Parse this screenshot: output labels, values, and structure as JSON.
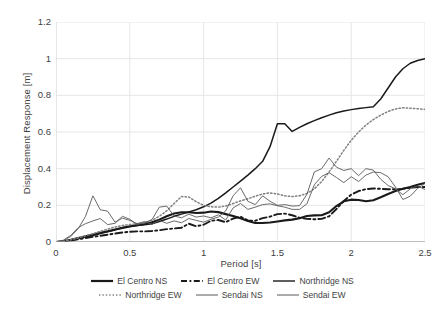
{
  "chart_data": {
    "type": "line",
    "title": "",
    "xlabel": "Period [s]",
    "ylabel": "Displacement Response [m]",
    "xlim": [
      0,
      2.5
    ],
    "ylim": [
      0,
      1.2
    ],
    "xticks": [
      "0",
      "0.5",
      "1",
      "1.5",
      "2",
      "2.5"
    ],
    "yticks": [
      "0",
      "0.2",
      "0.4",
      "0.6",
      "0.8",
      "1",
      "1.2"
    ],
    "grid": "horizontal-and-vertical",
    "legend_position": "bottom",
    "x": [
      0,
      0.05,
      0.1,
      0.15,
      0.2,
      0.25,
      0.3,
      0.35,
      0.4,
      0.45,
      0.5,
      0.55,
      0.6,
      0.65,
      0.7,
      0.75,
      0.8,
      0.85,
      0.9,
      0.95,
      1.0,
      1.05,
      1.1,
      1.15,
      1.2,
      1.25,
      1.3,
      1.35,
      1.4,
      1.45,
      1.5,
      1.55,
      1.6,
      1.65,
      1.7,
      1.75,
      1.8,
      1.85,
      1.9,
      1.95,
      2.0,
      2.05,
      2.1,
      2.15,
      2.2,
      2.25,
      2.3,
      2.35,
      2.4,
      2.45,
      2.5
    ],
    "series": [
      {
        "name": "El Centro NS",
        "style": "solid",
        "width": 2.1,
        "color": "#1a1a1a",
        "values": [
          0,
          0.004,
          0.012,
          0.022,
          0.031,
          0.04,
          0.05,
          0.059,
          0.068,
          0.077,
          0.085,
          0.092,
          0.098,
          0.108,
          0.122,
          0.14,
          0.155,
          0.162,
          0.162,
          0.158,
          0.16,
          0.166,
          0.163,
          0.152,
          0.142,
          0.13,
          0.114,
          0.104,
          0.104,
          0.106,
          0.112,
          0.118,
          0.122,
          0.13,
          0.142,
          0.145,
          0.146,
          0.162,
          0.196,
          0.222,
          0.231,
          0.229,
          0.222,
          0.228,
          0.244,
          0.262,
          0.278,
          0.29,
          0.3,
          0.312,
          0.322
        ]
      },
      {
        "name": "El Centro EW",
        "style": "dashed",
        "width": 1.9,
        "color": "#1a1a1a",
        "values": [
          0,
          0.003,
          0.008,
          0.015,
          0.022,
          0.028,
          0.034,
          0.04,
          0.046,
          0.052,
          0.056,
          0.058,
          0.058,
          0.06,
          0.064,
          0.07,
          0.074,
          0.078,
          0.1,
          0.086,
          0.094,
          0.116,
          0.12,
          0.108,
          0.128,
          0.138,
          0.118,
          0.116,
          0.13,
          0.138,
          0.152,
          0.155,
          0.146,
          0.132,
          0.126,
          0.124,
          0.126,
          0.14,
          0.18,
          0.224,
          0.258,
          0.278,
          0.288,
          0.292,
          0.29,
          0.288,
          0.288,
          0.29,
          0.296,
          0.3,
          0.3
        ]
      },
      {
        "name": "Northridge NS",
        "style": "solid",
        "width": 1.5,
        "color": "#1a1a1a",
        "values": [
          0,
          0.003,
          0.009,
          0.018,
          0.028,
          0.036,
          0.046,
          0.056,
          0.066,
          0.078,
          0.086,
          0.09,
          0.094,
          0.1,
          0.112,
          0.125,
          0.14,
          0.152,
          0.164,
          0.176,
          0.192,
          0.212,
          0.238,
          0.268,
          0.3,
          0.332,
          0.365,
          0.4,
          0.44,
          0.52,
          0.645,
          0.645,
          0.603,
          0.625,
          0.645,
          0.662,
          0.678,
          0.692,
          0.705,
          0.715,
          0.722,
          0.728,
          0.733,
          0.738,
          0.78,
          0.84,
          0.9,
          0.945,
          0.975,
          0.99,
          1.0
        ]
      },
      {
        "name": "Northridge EW",
        "style": "dotted",
        "width": 1.5,
        "color": "#808080",
        "values": [
          0,
          0.004,
          0.012,
          0.022,
          0.034,
          0.046,
          0.058,
          0.07,
          0.082,
          0.09,
          0.095,
          0.1,
          0.105,
          0.118,
          0.14,
          0.17,
          0.21,
          0.248,
          0.245,
          0.22,
          0.2,
          0.192,
          0.19,
          0.196,
          0.21,
          0.224,
          0.236,
          0.25,
          0.262,
          0.268,
          0.262,
          0.252,
          0.248,
          0.252,
          0.265,
          0.29,
          0.33,
          0.382,
          0.44,
          0.5,
          0.555,
          0.6,
          0.638,
          0.668,
          0.692,
          0.712,
          0.726,
          0.732,
          0.73,
          0.727,
          0.723
        ]
      },
      {
        "name": "Sendai NS",
        "style": "solid",
        "width": 0.9,
        "color": "#595959",
        "values": [
          0,
          0.008,
          0.03,
          0.072,
          0.14,
          0.252,
          0.176,
          0.168,
          0.108,
          0.13,
          0.118,
          0.1,
          0.112,
          0.096,
          0.118,
          0.102,
          0.115,
          0.105,
          0.128,
          0.118,
          0.108,
          0.124,
          0.136,
          0.17,
          0.252,
          0.296,
          0.222,
          0.204,
          0.252,
          0.222,
          0.2,
          0.204,
          0.196,
          0.198,
          0.26,
          0.382,
          0.4,
          0.458,
          0.408,
          0.39,
          0.4,
          0.362,
          0.4,
          0.392,
          0.342,
          0.308,
          0.29,
          0.258,
          0.29,
          0.306,
          0.286
        ]
      },
      {
        "name": "Sendai EW",
        "style": "solid",
        "width": 0.9,
        "color": "#595959",
        "values": [
          0,
          0.01,
          0.036,
          0.078,
          0.1,
          0.115,
          0.128,
          0.095,
          0.102,
          0.14,
          0.124,
          0.095,
          0.105,
          0.122,
          0.19,
          0.196,
          0.142,
          0.132,
          0.152,
          0.136,
          0.142,
          0.132,
          0.148,
          0.12,
          0.186,
          0.21,
          0.178,
          0.19,
          0.204,
          0.208,
          0.198,
          0.19,
          0.178,
          0.178,
          0.208,
          0.312,
          0.358,
          0.378,
          0.352,
          0.324,
          0.356,
          0.33,
          0.365,
          0.382,
          0.378,
          0.356,
          0.3,
          0.232,
          0.25,
          0.292,
          0.32
        ]
      }
    ]
  },
  "legend": {
    "rows": [
      [
        {
          "label": "El Centro NS",
          "style": "solid-thick",
          "icon": "legend-line-solid-icon"
        },
        {
          "label": "El Centro EW",
          "style": "dashed",
          "icon": "legend-line-dashed-icon"
        },
        {
          "label": "Northridge NS",
          "style": "solid",
          "icon": "legend-line-solid-icon"
        }
      ],
      [
        {
          "label": "Northridge EW",
          "style": "dotted",
          "icon": "legend-line-dotted-icon"
        },
        {
          "label": "Sendai NS",
          "style": "thin",
          "icon": "legend-line-thin-icon"
        },
        {
          "label": "Sendai EW",
          "style": "thin",
          "icon": "legend-line-thin-icon"
        }
      ]
    ]
  },
  "colors": {
    "axis": "#d9d9d9",
    "grid": "#e6e6e6",
    "text": "#404040",
    "primary": "#1a1a1a",
    "secondary": "#808080"
  }
}
